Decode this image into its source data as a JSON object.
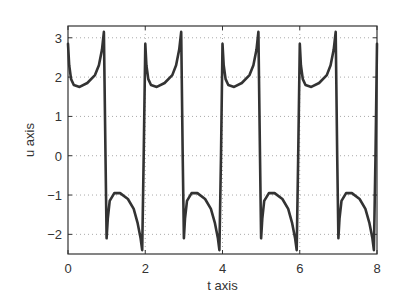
{
  "chart_data": {
    "type": "line",
    "title": "",
    "xlabel": "t axis",
    "ylabel": "u axis",
    "xlim": [
      0,
      8
    ],
    "ylim": [
      -2.5,
      3.3
    ],
    "xticks": [
      0,
      2,
      4,
      6,
      8
    ],
    "yticks": [
      -2,
      -1,
      0,
      1,
      2,
      3
    ],
    "xtick_labels": [
      "0",
      "2",
      "4",
      "6",
      "8"
    ],
    "ytick_labels": [
      "−2",
      "−1",
      "0",
      "1",
      "2",
      "3"
    ],
    "grid": true,
    "grid_style": "dotted",
    "legend": null,
    "series": [
      {
        "name": "u(t)",
        "color": "#333333",
        "description": "Periodic relaxation-type oscillation with period 2: on odd half-periods the value starts near 2.8 (spike), dips to ~1.75 then rises to ~3.15 before dropping sharply; on even half-periods it starts at ~-2.1 spike, rises to ~-0.95 then falls to ~-2.4 before jumping back up.",
        "points": [
          [
            0.0,
            2.85
          ],
          [
            0.03,
            2.3
          ],
          [
            0.08,
            1.95
          ],
          [
            0.15,
            1.8
          ],
          [
            0.3,
            1.75
          ],
          [
            0.5,
            1.85
          ],
          [
            0.7,
            2.05
          ],
          [
            0.8,
            2.3
          ],
          [
            0.88,
            2.7
          ],
          [
            0.93,
            3.15
          ],
          [
            0.97,
            0.0
          ],
          [
            1.0,
            -2.1
          ],
          [
            1.03,
            -1.6
          ],
          [
            1.08,
            -1.15
          ],
          [
            1.2,
            -0.95
          ],
          [
            1.35,
            -0.95
          ],
          [
            1.55,
            -1.1
          ],
          [
            1.7,
            -1.35
          ],
          [
            1.8,
            -1.7
          ],
          [
            1.88,
            -2.1
          ],
          [
            1.92,
            -2.4
          ],
          [
            1.96,
            0.0
          ],
          [
            2.0,
            2.85
          ],
          [
            2.03,
            2.3
          ],
          [
            2.08,
            1.95
          ],
          [
            2.15,
            1.8
          ],
          [
            2.3,
            1.75
          ],
          [
            2.5,
            1.85
          ],
          [
            2.7,
            2.05
          ],
          [
            2.8,
            2.3
          ],
          [
            2.88,
            2.7
          ],
          [
            2.93,
            3.15
          ],
          [
            2.97,
            0.0
          ],
          [
            3.0,
            -2.1
          ],
          [
            3.03,
            -1.6
          ],
          [
            3.08,
            -1.15
          ],
          [
            3.2,
            -0.95
          ],
          [
            3.35,
            -0.95
          ],
          [
            3.55,
            -1.1
          ],
          [
            3.7,
            -1.35
          ],
          [
            3.8,
            -1.7
          ],
          [
            3.88,
            -2.1
          ],
          [
            3.92,
            -2.4
          ],
          [
            3.96,
            0.0
          ],
          [
            4.0,
            2.85
          ],
          [
            4.03,
            2.3
          ],
          [
            4.08,
            1.95
          ],
          [
            4.15,
            1.8
          ],
          [
            4.3,
            1.75
          ],
          [
            4.5,
            1.85
          ],
          [
            4.7,
            2.05
          ],
          [
            4.8,
            2.3
          ],
          [
            4.88,
            2.7
          ],
          [
            4.93,
            3.15
          ],
          [
            4.97,
            0.0
          ],
          [
            5.0,
            -2.1
          ],
          [
            5.03,
            -1.6
          ],
          [
            5.08,
            -1.15
          ],
          [
            5.2,
            -0.95
          ],
          [
            5.35,
            -0.95
          ],
          [
            5.55,
            -1.1
          ],
          [
            5.7,
            -1.35
          ],
          [
            5.8,
            -1.7
          ],
          [
            5.88,
            -2.1
          ],
          [
            5.92,
            -2.4
          ],
          [
            5.96,
            0.0
          ],
          [
            6.0,
            2.85
          ],
          [
            6.03,
            2.3
          ],
          [
            6.08,
            1.95
          ],
          [
            6.15,
            1.8
          ],
          [
            6.3,
            1.75
          ],
          [
            6.5,
            1.85
          ],
          [
            6.7,
            2.05
          ],
          [
            6.8,
            2.3
          ],
          [
            6.88,
            2.7
          ],
          [
            6.93,
            3.15
          ],
          [
            6.97,
            0.0
          ],
          [
            7.0,
            -2.1
          ],
          [
            7.03,
            -1.6
          ],
          [
            7.08,
            -1.15
          ],
          [
            7.2,
            -0.95
          ],
          [
            7.35,
            -0.95
          ],
          [
            7.55,
            -1.1
          ],
          [
            7.7,
            -1.35
          ],
          [
            7.8,
            -1.7
          ],
          [
            7.88,
            -2.1
          ],
          [
            7.92,
            -2.4
          ],
          [
            7.96,
            0.0
          ],
          [
            8.0,
            2.85
          ]
        ]
      }
    ]
  },
  "layout": {
    "plot_left": 68,
    "plot_right": 377,
    "plot_top": 26,
    "plot_bottom": 254
  }
}
